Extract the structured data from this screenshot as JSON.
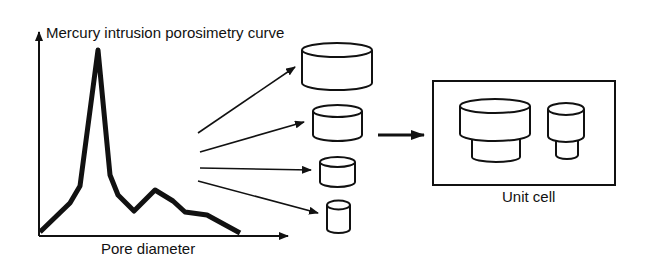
{
  "diagram": {
    "curve_title": "Mercury intrusion porosimetry curve",
    "x_axis_label": "Pore diameter",
    "unit_cell_label": "Unit cell",
    "curve_points": [
      [
        40,
        232
      ],
      [
        70,
        203
      ],
      [
        80,
        186
      ],
      [
        98,
        50
      ],
      [
        110,
        175
      ],
      [
        118,
        195
      ],
      [
        134,
        211
      ],
      [
        155,
        190
      ],
      [
        173,
        201
      ],
      [
        185,
        212
      ],
      [
        207,
        215
      ],
      [
        240,
        233
      ]
    ],
    "pore_classes": [
      "largest pore cylinder",
      "large pore cylinder",
      "medium pore cylinder",
      "small pore cylinder"
    ],
    "stroke_color": "#111111"
  }
}
